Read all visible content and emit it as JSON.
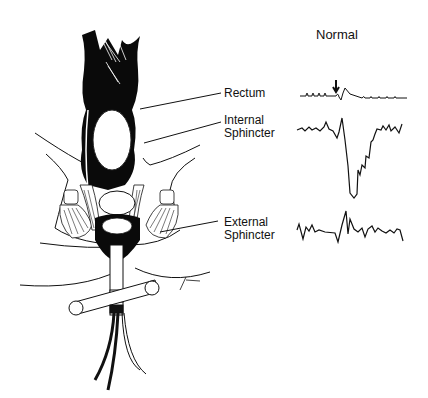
{
  "figure": {
    "title": "Normal",
    "labels": {
      "rectum": "Rectum",
      "internal_line1": "Internal",
      "internal_line2": "Sphincter",
      "external_line1": "External",
      "external_line2": "Sphincter"
    },
    "traces": [
      {
        "name": "rectum",
        "description": "baseline with small periodic spikes, arrow marks stimulus, brief deflection"
      },
      {
        "name": "internal-sphincter",
        "description": "noisy baseline, sharp spike then deep relaxation dip, gradual recovery"
      },
      {
        "name": "external-sphincter",
        "description": "noisy baseline with contraction burst at stimulus"
      }
    ],
    "signature": "g. Bau"
  }
}
